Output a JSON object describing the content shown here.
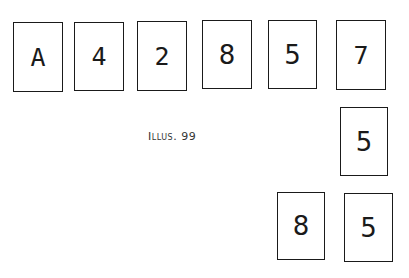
{
  "illustration": {
    "caption": "Illus. 99",
    "top_row": [
      "A",
      "4",
      "2",
      "8",
      "5",
      "7"
    ],
    "column_card": "5",
    "bottom_row": [
      "8",
      "5"
    ]
  }
}
